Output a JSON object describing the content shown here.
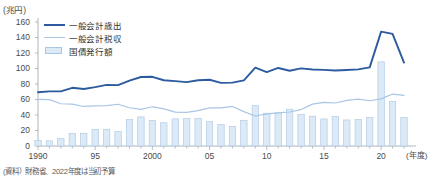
{
  "chart_data": {
    "type": "line",
    "title": "",
    "unit_label": "(兆円)",
    "xlabel": "(年度)",
    "ylabel": "",
    "ylim": [
      0,
      160
    ],
    "yticks": [
      0,
      20,
      40,
      60,
      80,
      100,
      120,
      140,
      160
    ],
    "xlim": [
      1990,
      2022
    ],
    "xticks": [
      1990,
      1995,
      2000,
      2005,
      2010,
      2015,
      2020
    ],
    "xtick_labels": [
      "1990",
      "95",
      "2000",
      "05",
      "10",
      "15",
      "20"
    ],
    "grid": false,
    "legend_position": "top-left",
    "x": [
      1990,
      1991,
      1992,
      1993,
      1994,
      1995,
      1996,
      1997,
      1998,
      1999,
      2000,
      2001,
      2002,
      2003,
      2004,
      2005,
      2006,
      2007,
      2008,
      2009,
      2010,
      2011,
      2012,
      2013,
      2014,
      2015,
      2016,
      2017,
      2018,
      2019,
      2020,
      2021,
      2022
    ],
    "series": [
      {
        "name": "一般会計歳出",
        "type": "line",
        "color": "#2d5ba0",
        "values": [
          69.3,
          70.5,
          70.5,
          75.1,
          73.6,
          75.9,
          78.8,
          78.5,
          84.4,
          89.0,
          89.3,
          84.8,
          83.7,
          82.4,
          84.9,
          85.5,
          81.4,
          81.8,
          84.7,
          101.0,
          95.3,
          100.7,
          97.1,
          100.2,
          98.8,
          98.2,
          97.5,
          98.1,
          98.9,
          101.4,
          147.6,
          144.6,
          107.6
        ]
      },
      {
        "name": "一般会計税収",
        "type": "line",
        "color": "#a9c6e4",
        "values": [
          60.1,
          59.8,
          54.5,
          54.1,
          51.0,
          51.9,
          52.1,
          53.9,
          49.4,
          47.2,
          50.7,
          47.9,
          43.8,
          43.3,
          45.6,
          49.1,
          49.1,
          51.0,
          44.3,
          38.7,
          41.5,
          42.8,
          43.9,
          47.0,
          54.0,
          56.3,
          55.5,
          58.8,
          60.4,
          58.4,
          60.8,
          67.0,
          65.2
        ]
      },
      {
        "name": "国債発行額",
        "type": "bar",
        "color": "#dce9f6",
        "border_color": "#a9c6e4",
        "values": [
          7.3,
          6.7,
          9.5,
          16.2,
          16.5,
          21.2,
          21.7,
          18.5,
          34.0,
          37.5,
          33.0,
          30.0,
          35.0,
          35.3,
          35.5,
          31.3,
          27.5,
          25.4,
          33.2,
          52.0,
          42.3,
          42.8,
          47.5,
          40.9,
          38.5,
          34.9,
          38.0,
          33.6,
          34.4,
          36.6,
          108.6,
          57.7,
          36.9
        ]
      }
    ],
    "annotations": []
  },
  "source": {
    "note": "(資料）財務省、2022年度は当初予算"
  },
  "colors": {
    "expenditure_line": "#2d5ba0",
    "tax_line": "#a9c6e4",
    "bond_bar_fill": "#dce9f6",
    "bond_bar_border": "#a9c6e4",
    "axis": "#9aa3ab",
    "text": "#3a3a3a",
    "background": "#ffffff"
  }
}
